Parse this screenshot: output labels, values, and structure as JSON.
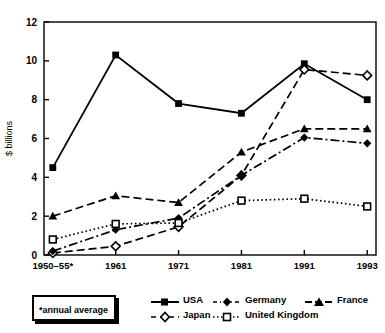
{
  "chart_data": {
    "type": "line",
    "title": "",
    "xlabel": "",
    "ylabel": "$ billions",
    "categories": [
      "1950–55*",
      "1961",
      "1971",
      "1981",
      "1991",
      "1993"
    ],
    "ylim": [
      0,
      12
    ],
    "yticks": [
      0,
      2,
      4,
      6,
      8,
      10,
      12
    ],
    "ytick_labels": [
      "0",
      "2",
      "4",
      "6",
      "8",
      "10",
      "12"
    ],
    "grid": false,
    "legend_position": "bottom",
    "annotation": "*annual average",
    "series": [
      {
        "name": "USA",
        "marker": "filled-square",
        "line": "solid",
        "color": "#000000",
        "values": [
          4.5,
          10.3,
          7.8,
          7.3,
          9.85,
          8.0
        ]
      },
      {
        "name": "Japan",
        "marker": "open-diamond",
        "line": "dashed",
        "color": "#000000",
        "values": [
          0.1,
          0.45,
          1.45,
          4.1,
          9.55,
          9.25
        ]
      },
      {
        "name": "Germany",
        "marker": "filled-diamond",
        "line": "dash-dot",
        "color": "#000000",
        "values": [
          0.2,
          1.3,
          1.9,
          4.1,
          6.05,
          5.75
        ]
      },
      {
        "name": "United Kingdom",
        "marker": "open-square",
        "line": "dotted",
        "color": "#000000",
        "values": [
          0.8,
          1.6,
          1.65,
          2.8,
          2.9,
          2.5
        ]
      },
      {
        "name": "France",
        "marker": "filled-triangle",
        "line": "dashed",
        "color": "#000000",
        "values": [
          2.0,
          3.05,
          2.7,
          5.3,
          6.5,
          6.5
        ]
      }
    ]
  },
  "legend": {
    "note": "*annual average",
    "rows": [
      [
        "USA",
        "Germany",
        "France"
      ],
      [
        "Japan",
        "United Kingdom"
      ]
    ]
  }
}
